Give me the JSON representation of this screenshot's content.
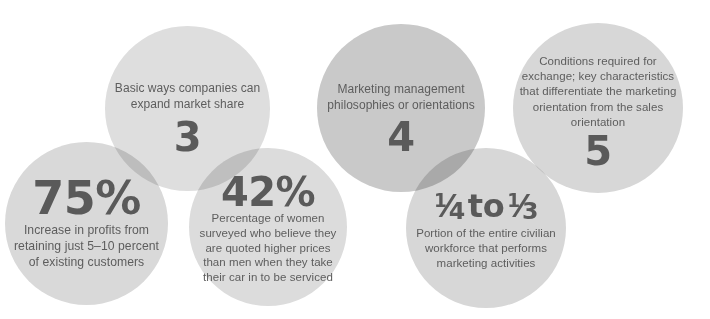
{
  "graphic": {
    "title": "Marketing by the Numbers",
    "type": "overlapping-circles-infographic",
    "background_color": "#ffffff",
    "text_color": "#5b5b5b"
  },
  "bubbles": [
    {
      "id": "75-percent",
      "figure": "75%",
      "caption": "Increase in profits from retaining just 5–10 percent of existing customers",
      "fill_color": "#d9d9d9",
      "order": 1
    },
    {
      "id": "three",
      "figure": "3",
      "caption": "Basic ways companies can expand market share",
      "fill_color": "#dedede",
      "order": 2
    },
    {
      "id": "42-percent",
      "figure": "42%",
      "caption": "Percentage of women surveyed who believe they are quoted higher prices than men when they take their car in to be serviced",
      "fill_color": "#dcdcdc",
      "order": 3
    },
    {
      "id": "four",
      "figure": "4",
      "caption": "Marketing management philosophies or orientations",
      "fill_color": "#c9c9c9",
      "order": 4
    },
    {
      "id": "quarter-to-third",
      "figure": "¼ to ⅓",
      "figure_parts": {
        "first_numerator": "1",
        "first_denominator": "4",
        "connector": "to",
        "second_numerator": "1",
        "second_denominator": "3",
        "slash": "⁄"
      },
      "caption": "Portion of the entire civilian workforce that performs marketing activities",
      "fill_color": "#d7d7d7",
      "order": 5
    },
    {
      "id": "five",
      "figure": "5",
      "caption": "Conditions required for exchange; key characteristics that differentiate the marketing orientation from the sales orientation",
      "fill_color": "#d7d7d7",
      "order": 6
    }
  ]
}
